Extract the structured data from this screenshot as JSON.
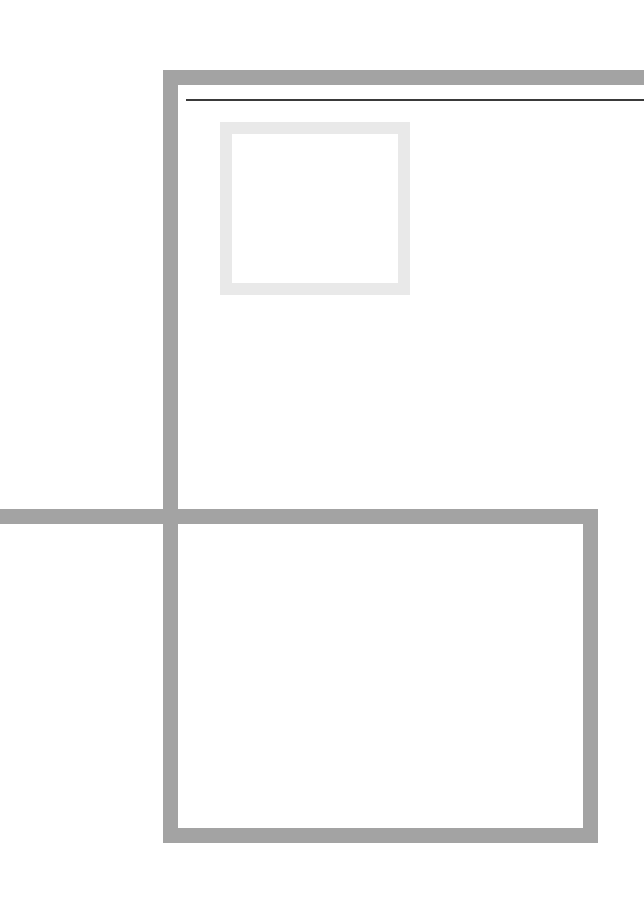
{
  "view": {
    "width": 644,
    "height": 913,
    "background_color": "#ffffff",
    "description": "Extreme zoom / cropped view of a UI showing only frame borders and outlines; no legible text is rendered at this magnification."
  },
  "palette": {
    "frame_gray": "#a3a3a3",
    "hairline_dark": "#3a3a3a",
    "pale_outline": "#e9e9e9",
    "canvas_white": "#ffffff"
  },
  "elements": {
    "frame_top": {
      "label": "",
      "color": "#a3a3a3",
      "x": 163,
      "y": 70,
      "width": 481,
      "height": 15,
      "clipped_right": true
    },
    "frame_left": {
      "label": "",
      "color": "#a3a3a3",
      "x": 163,
      "y": 70,
      "width": 15,
      "height": 773
    },
    "frame_right": {
      "label": "",
      "color": "#a3a3a3",
      "x": 583,
      "y": 509,
      "width": 15,
      "height": 334
    },
    "frame_bottom": {
      "label": "",
      "color": "#a3a3a3",
      "x": 163,
      "y": 828,
      "width": 435,
      "height": 15
    },
    "divider_mid": {
      "label": "",
      "color": "#a3a3a3",
      "x": 0,
      "y": 509,
      "width": 598,
      "height": 15,
      "clipped_left": true
    },
    "hairline_rule": {
      "label": "",
      "color": "#3a3a3a",
      "x": 186,
      "y": 99,
      "width": 458,
      "height": 2,
      "clipped_right": true
    },
    "pale_square": {
      "label": "",
      "border_color": "#e9e9e9",
      "border_width": 12,
      "x": 220,
      "y": 122,
      "width": 190,
      "height": 173,
      "fill": "#ffffff"
    },
    "upper_panel": {
      "label": "",
      "fill": "#ffffff",
      "x": 178,
      "y": 85,
      "width": 466,
      "height": 424
    },
    "lower_panel": {
      "label": "",
      "fill": "#ffffff",
      "x": 178,
      "y": 524,
      "width": 405,
      "height": 304
    }
  },
  "text": {
    "visible_strings": []
  }
}
